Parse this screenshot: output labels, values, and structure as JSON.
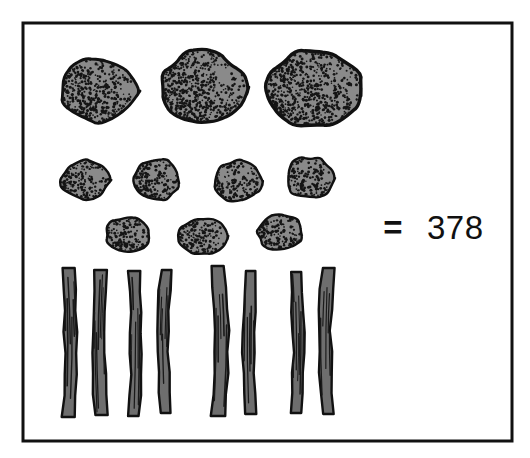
{
  "figure": {
    "kind": "tally-illustration",
    "background_color": "#ffffff",
    "frame": {
      "name": "illustration-border",
      "stroke_color": "#111111",
      "stroke_width": 3,
      "x": 23,
      "y": 23,
      "width": 489,
      "height": 418
    },
    "equation": {
      "operator": "=",
      "total": "378"
    },
    "palette": {
      "stone_fill": "#8a8a8a",
      "stone_outline": "#111111",
      "stone_stipple": "#151515",
      "stick_fill": "#6e6e6e",
      "stick_outline": "#111111",
      "stick_grain": "#1a1a1a",
      "text_color": "#111111"
    },
    "groups": [
      {
        "name": "large-stones-row",
        "label": "large stones",
        "count": 3,
        "items": [
          {
            "cx": 99,
            "cy": 91,
            "rx": 38,
            "ry": 32,
            "seed": 11
          },
          {
            "cx": 202,
            "cy": 87,
            "rx": 43,
            "ry": 36,
            "seed": 23
          },
          {
            "cx": 314,
            "cy": 88,
            "rx": 46,
            "ry": 38,
            "seed": 37
          }
        ]
      },
      {
        "name": "medium-stones-row",
        "label": "medium stones",
        "count": 4,
        "items": [
          {
            "cx": 85,
            "cy": 180,
            "rx": 24,
            "ry": 20,
            "seed": 41
          },
          {
            "cx": 157,
            "cy": 179,
            "rx": 24,
            "ry": 21,
            "seed": 53
          },
          {
            "cx": 238,
            "cy": 181,
            "rx": 24,
            "ry": 21,
            "seed": 67
          },
          {
            "cx": 310,
            "cy": 178,
            "rx": 24,
            "ry": 21,
            "seed": 79
          }
        ]
      },
      {
        "name": "small-stones-row",
        "label": "small stones",
        "count": 3,
        "items": [
          {
            "cx": 128,
            "cy": 235,
            "rx": 23,
            "ry": 18,
            "seed": 83
          },
          {
            "cx": 203,
            "cy": 236,
            "rx": 24,
            "ry": 19,
            "seed": 97
          },
          {
            "cx": 280,
            "cy": 232,
            "rx": 23,
            "ry": 18,
            "seed": 101
          }
        ]
      },
      {
        "name": "sticks-row",
        "label": "sticks",
        "count": 8,
        "items": [
          {
            "x": 68,
            "top": 268,
            "bottom": 417,
            "w": 12,
            "sway": 3.0,
            "seed": 5
          },
          {
            "x": 101,
            "top": 270,
            "bottom": 415,
            "w": 12,
            "sway": -2.5,
            "seed": 9
          },
          {
            "x": 134,
            "top": 271,
            "bottom": 416,
            "w": 11,
            "sway": 2.0,
            "seed": 13
          },
          {
            "x": 166,
            "top": 270,
            "bottom": 413,
            "w": 11,
            "sway": -3.0,
            "seed": 17
          },
          {
            "x": 218,
            "top": 266,
            "bottom": 416,
            "w": 13,
            "sway": 3.5,
            "seed": 21
          },
          {
            "x": 251,
            "top": 271,
            "bottom": 414,
            "w": 11,
            "sway": -2.0,
            "seed": 27
          },
          {
            "x": 296,
            "top": 272,
            "bottom": 413,
            "w": 11,
            "sway": 2.5,
            "seed": 31
          },
          {
            "x": 328,
            "top": 268,
            "bottom": 414,
            "w": 12,
            "sway": -2.8,
            "seed": 35
          }
        ]
      }
    ],
    "equals_position": {
      "x": 393,
      "y": 230
    },
    "total_position": {
      "x": 427,
      "y": 230
    }
  },
  "chart_data": {
    "type": "table",
    "categories": [
      "large stones",
      "medium stones",
      "small stones",
      "sticks"
    ],
    "values": [
      3,
      4,
      3,
      8
    ],
    "annotations": [
      "= 378"
    ],
    "xlabel": "",
    "ylabel": "count"
  }
}
